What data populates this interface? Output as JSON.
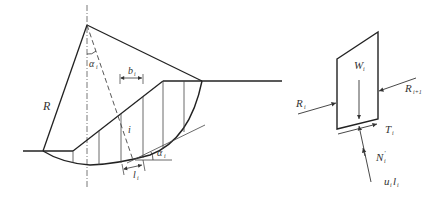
{
  "figure": {
    "left": {
      "labels": {
        "R": "R",
        "alpha_top": "α",
        "alpha_top_sub": "i",
        "b": "b",
        "b_sub": "i",
        "slice_index": "i",
        "l": "l",
        "l_sub": "i",
        "alpha_bottom": "α",
        "alpha_bottom_sub": "i"
      }
    },
    "right": {
      "labels": {
        "W": "W",
        "W_sub": "i",
        "R_left": "R",
        "R_left_sub": "i",
        "R_right": "R",
        "R_right_sub": "i+1",
        "T": "T",
        "T_sub": "i",
        "N": "N",
        "N_sub": "i",
        "N_prime": "′",
        "u": "u",
        "u_sub": "i",
        "ul_l": "l",
        "ul_l_sub": "i"
      }
    }
  }
}
